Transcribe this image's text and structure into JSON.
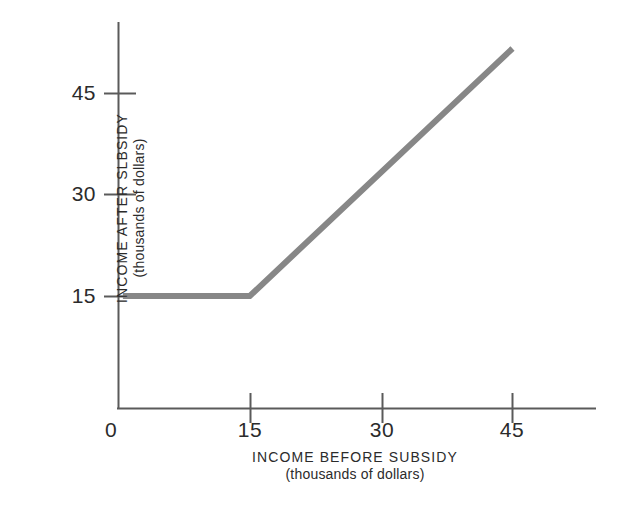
{
  "chart_data": {
    "type": "line",
    "title": "",
    "subtitle": "",
    "xlabel": "INCOME BEFORE SUBSIDY",
    "xlabel_sub": "(thousands of dollars)",
    "ylabel": "INCOME AFTER SLBSIDY",
    "ylabel_sub": "(thousands of dollars)",
    "xlim": [
      0,
      52
    ],
    "ylim": [
      0,
      52
    ],
    "xticks": [
      0,
      15,
      30,
      45
    ],
    "xtick_labels": [
      "0",
      "15",
      "30",
      "45"
    ],
    "yticks": [
      15,
      30,
      45
    ],
    "ytick_labels": [
      "15",
      "30",
      "45"
    ],
    "grid": false,
    "legend": false,
    "legend_position": "none",
    "series": [
      {
        "name": "income after subsidy",
        "color": "#878787",
        "line_width": 6,
        "x": [
          0.5,
          15,
          45
        ],
        "y": [
          15,
          15,
          48
        ]
      }
    ],
    "annotations": []
  },
  "axes": {
    "line_color": "#5a5a5a",
    "tick_color": "#5a5a5a"
  },
  "ticks": {
    "x": [
      {
        "label": "0"
      },
      {
        "label": "15"
      },
      {
        "label": "30"
      },
      {
        "label": "45"
      }
    ],
    "y": [
      {
        "label": "15"
      },
      {
        "label": "30"
      },
      {
        "label": "45"
      }
    ]
  }
}
